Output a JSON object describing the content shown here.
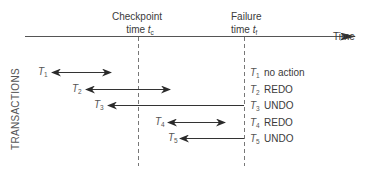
{
  "diagram": {
    "axis": {
      "label": "Time"
    },
    "markers": [
      {
        "id": "checkpoint",
        "title": "Checkpoint",
        "time_prefix": "time",
        "time_var": "t",
        "time_sub": "c",
        "x": 138
      },
      {
        "id": "failure",
        "title": "Failure",
        "time_prefix": "time",
        "time_var": "t",
        "time_sub": "f",
        "x": 244
      }
    ],
    "y_axis_label": "TRANSACTIONS",
    "transactions": [
      {
        "name": "T",
        "sub": "1",
        "start_x": 52,
        "end_x": 111,
        "y": 72,
        "arrow": "both",
        "action": "no action"
      },
      {
        "name": "T",
        "sub": "2",
        "start_x": 86,
        "end_x": 170,
        "y": 89,
        "arrow": "both",
        "action": "REDO"
      },
      {
        "name": "T",
        "sub": "3",
        "start_x": 108,
        "end_x": 244,
        "y": 105,
        "arrow": "left",
        "action": "UNDO"
      },
      {
        "name": "T",
        "sub": "4",
        "start_x": 168,
        "end_x": 225,
        "y": 122,
        "arrow": "both",
        "action": "REDO"
      },
      {
        "name": "T",
        "sub": "5",
        "start_x": 180,
        "end_x": 244,
        "y": 138,
        "arrow": "left",
        "action": "UNDO"
      }
    ],
    "colors": {
      "line": "#3a3a3a",
      "dashed": "#777777",
      "text": "#3a3a3a"
    }
  }
}
